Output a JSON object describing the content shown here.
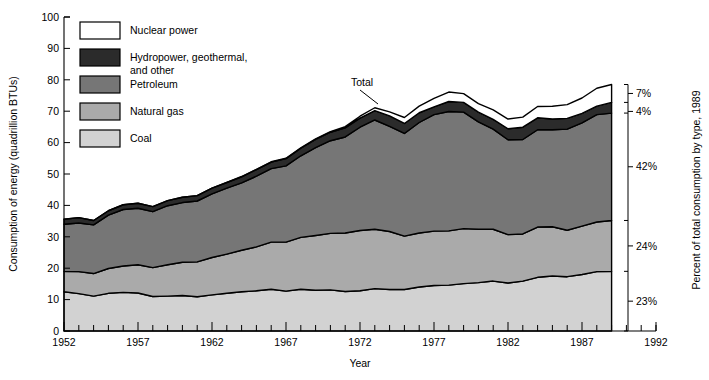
{
  "chart_data": {
    "type": "area",
    "title": "",
    "xlabel": "Year",
    "ylabel": "Consumption of energy (quadrillion BTUs)",
    "y2label": "Percent of total consumption by type, 1989",
    "xlim": [
      1952,
      1992
    ],
    "ylim": [
      0,
      100
    ],
    "xticks": [
      1952,
      1957,
      1962,
      1967,
      1972,
      1977,
      1982,
      1987,
      1992
    ],
    "xtick_labels": [
      "1952",
      "1957",
      "1962",
      "1967",
      "1972",
      "1977",
      "1982",
      "1987",
      "1992"
    ],
    "yticks": [
      0,
      10,
      20,
      30,
      40,
      50,
      60,
      70,
      80,
      90,
      100
    ],
    "ytick_labels": [
      "0",
      "10",
      "20",
      "30",
      "40",
      "50",
      "60",
      "70",
      "80",
      "90",
      "100"
    ],
    "grid": false,
    "stacked": true,
    "legend_position": "top-left",
    "annotations": [
      {
        "text": "Total",
        "x": 1970,
        "y": 86,
        "note": "points to top of stacked total curve"
      }
    ],
    "x": [
      1952,
      1953,
      1954,
      1955,
      1956,
      1957,
      1958,
      1959,
      1960,
      1961,
      1962,
      1963,
      1964,
      1965,
      1966,
      1967,
      1968,
      1969,
      1970,
      1971,
      1972,
      1973,
      1974,
      1975,
      1976,
      1977,
      1978,
      1979,
      1980,
      1981,
      1982,
      1983,
      1984,
      1985,
      1986,
      1987,
      1988,
      1989
    ],
    "series": [
      {
        "name": "Coal",
        "color": "#d2d2d2",
        "values": [
          12.5,
          11.9,
          11.1,
          12.0,
          12.3,
          12.1,
          11.0,
          11.1,
          11.3,
          10.9,
          11.5,
          12.0,
          12.5,
          12.8,
          13.3,
          12.7,
          13.3,
          13.0,
          13.1,
          12.6,
          12.8,
          13.5,
          13.2,
          13.2,
          14.0,
          14.5,
          14.6,
          15.1,
          15.4,
          15.9,
          15.3,
          15.9,
          17.1,
          17.5,
          17.3,
          18.0,
          18.9,
          19.0
        ]
      },
      {
        "name": "Natural gas",
        "color": "#aaaaaa",
        "values": [
          6.5,
          7.0,
          7.2,
          7.9,
          8.4,
          9.0,
          9.2,
          10.0,
          10.6,
          11.1,
          11.9,
          12.5,
          13.2,
          14.0,
          15.0,
          15.6,
          16.5,
          17.4,
          18.0,
          18.6,
          19.2,
          18.9,
          18.5,
          17.0,
          17.2,
          17.3,
          17.3,
          17.5,
          17.0,
          16.5,
          15.4,
          15.0,
          16.0,
          15.7,
          14.8,
          15.4,
          15.8,
          16.2
        ]
      },
      {
        "name": "Petroleum",
        "color": "#767676",
        "values": [
          15.0,
          15.5,
          15.5,
          17.0,
          18.0,
          18.0,
          17.8,
          18.8,
          19.0,
          19.4,
          20.3,
          21.0,
          21.5,
          22.5,
          23.4,
          24.3,
          26.0,
          28.0,
          29.5,
          30.6,
          32.9,
          34.8,
          33.5,
          32.7,
          35.2,
          37.1,
          38.0,
          37.1,
          34.2,
          31.9,
          30.2,
          30.1,
          31.0,
          30.9,
          32.2,
          32.9,
          34.2,
          34.2
        ]
      },
      {
        "name": "Hydropower, geothermal, and other",
        "color": "#2b2b2b",
        "values": [
          1.6,
          1.7,
          1.4,
          1.4,
          1.5,
          1.6,
          1.6,
          1.6,
          1.7,
          1.7,
          1.8,
          1.8,
          1.9,
          2.1,
          2.1,
          2.3,
          2.4,
          2.6,
          2.7,
          2.9,
          2.9,
          3.0,
          3.3,
          3.2,
          3.1,
          2.5,
          3.2,
          3.1,
          3.1,
          3.1,
          3.5,
          3.9,
          3.8,
          3.4,
          3.4,
          3.0,
          2.7,
          3.4
        ]
      },
      {
        "name": "Nuclear power",
        "color": "#ffffff",
        "values": [
          0.0,
          0.0,
          0.0,
          0.0,
          0.0,
          0.0,
          0.0,
          0.0,
          0.0,
          0.0,
          0.0,
          0.0,
          0.1,
          0.1,
          0.1,
          0.1,
          0.1,
          0.2,
          0.2,
          0.4,
          0.6,
          0.9,
          1.3,
          1.9,
          2.1,
          2.7,
          3.0,
          2.8,
          2.7,
          3.0,
          3.1,
          3.2,
          3.6,
          4.1,
          4.4,
          4.9,
          5.7,
          5.7
        ]
      }
    ],
    "right_axis_percents": [
      {
        "label": "7%",
        "series": "Nuclear power"
      },
      {
        "label": "4%",
        "series": "Hydropower, geothermal, and other"
      },
      {
        "label": "42%",
        "series": "Petroleum"
      },
      {
        "label": "24%",
        "series": "Natural gas"
      },
      {
        "label": "23%",
        "series": "Coal"
      }
    ]
  },
  "legend": {
    "items": [
      {
        "label": "Nuclear power",
        "color": "#ffffff"
      },
      {
        "label": "Hydropower, geothermal,",
        "label2": "and other",
        "color": "#2b2b2b"
      },
      {
        "label": "Petroleum",
        "color": "#767676"
      },
      {
        "label": "Natural gas",
        "color": "#aaaaaa"
      },
      {
        "label": "Coal",
        "color": "#d2d2d2"
      }
    ]
  },
  "axes": {
    "y_title": "Consumption of energy (quadrillion BTUs)",
    "x_title": "Year",
    "y2_title": "Percent of total consumption by type, 1989",
    "y_ticks": [
      "100",
      "90",
      "80",
      "70",
      "60",
      "50",
      "40",
      "30",
      "20",
      "10",
      "0"
    ],
    "x_ticks": [
      "1952",
      "1957",
      "1962",
      "1967",
      "1972",
      "1977",
      "1982",
      "1987",
      "1992"
    ]
  },
  "annotation": {
    "total_label": "Total"
  },
  "percents": {
    "nuclear": "7%",
    "hydro": "4%",
    "petroleum": "42%",
    "gas": "24%",
    "coal": "23%"
  }
}
